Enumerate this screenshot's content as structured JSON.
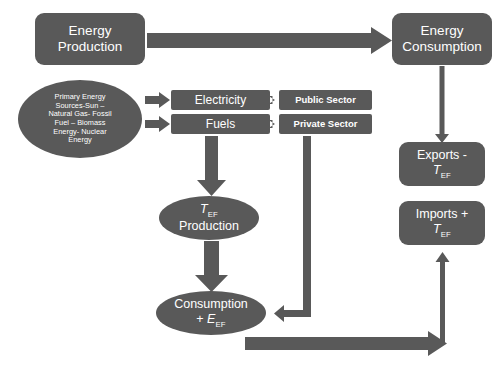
{
  "diagram": {
    "palette": {
      "node_fill": "#595959",
      "node_text": "#ffffff",
      "arrow_fill": "#595959",
      "background": "#ffffff"
    },
    "nodes": {
      "energy_production": {
        "label": "Energy Production",
        "line1": "Energy",
        "line2": "Production",
        "shape": "rounded-rectangle"
      },
      "energy_consumption": {
        "label": "Energy Consumption",
        "line1": "Energy",
        "line2": "Consumption",
        "shape": "rounded-rectangle"
      },
      "primary_sources": {
        "label": "Primary Energy Sources-Sun – Natural Gas- Fossil Fuel – Biomass Energy- Nuclear Energy",
        "line1": "Primary Energy",
        "line2": "Sources-Sun –",
        "line3": "Natural  Gas- Fossil",
        "line4": "Fuel – Biomass",
        "line5": "Energy-  Nuclear",
        "line6": "Energy",
        "shape": "ellipse"
      },
      "electricity": {
        "label": "Electricity",
        "shape": "bar"
      },
      "fuels": {
        "label": "Fuels",
        "shape": "bar"
      },
      "public_sector": {
        "label": "Public Sector",
        "shape": "bar"
      },
      "private_sector": {
        "label": "Private Sector",
        "shape": "bar"
      },
      "exports": {
        "label": "Exports - TEF",
        "line1": "Exports -",
        "symbol": "T",
        "subscript": "EF",
        "shape": "rounded-rectangle"
      },
      "imports": {
        "label": "Imports + TEF",
        "line1": "Imports +",
        "symbol": "T",
        "subscript": "EF",
        "shape": "rounded-rectangle"
      },
      "tef_production": {
        "label": "TEF Production",
        "symbol": "T",
        "subscript": "EF",
        "line2": "Production",
        "shape": "ellipse"
      },
      "consumption": {
        "label": "Consumption + EEF",
        "line1": "Consumption",
        "plus": "+ ",
        "symbol": "E",
        "subscript": "EF",
        "shape": "ellipse"
      }
    },
    "connectors": [
      {
        "name": "production-to-consumption",
        "from": "energy_production",
        "to": "energy_consumption",
        "style": "block-arrow-right"
      },
      {
        "name": "sources-to-electricity",
        "from": "primary_sources",
        "to": "electricity",
        "style": "block-arrow-right"
      },
      {
        "name": "sources-to-fuels",
        "from": "primary_sources",
        "to": "fuels",
        "style": "block-arrow-right"
      },
      {
        "name": "electricity-to-public-sector",
        "from": "electricity",
        "to": "public_sector",
        "style": "block-arrow-right"
      },
      {
        "name": "fuels-to-private-sector",
        "from": "fuels",
        "to": "private_sector",
        "style": "block-arrow-right"
      },
      {
        "name": "fuels-to-tef-production",
        "from": "fuels",
        "to": "tef_production",
        "style": "block-arrow-down"
      },
      {
        "name": "tef-production-to-consumption",
        "from": "tef_production",
        "to": "consumption",
        "style": "block-arrow-down"
      },
      {
        "name": "consumption-to-imports",
        "from": "consumption",
        "to": "imports",
        "style": "block-arrow-right-then-up"
      },
      {
        "name": "energy-consumption-to-exports",
        "from": "energy_consumption",
        "to": "exports",
        "style": "line-arrow-down"
      },
      {
        "name": "private-sector-to-consumption",
        "from": "private_sector",
        "to": "consumption",
        "style": "elbow-arrow-down-left"
      }
    ]
  }
}
